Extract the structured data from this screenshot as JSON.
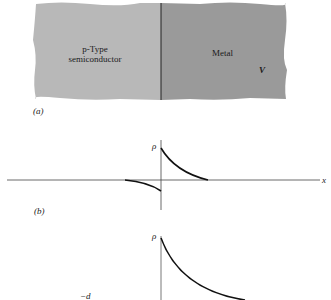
{
  "panel_a": {
    "caption": "(a)",
    "semiconductor_label_line1": "p-Type",
    "semiconductor_label_line2": "semiconductor",
    "metal_label": "Metal",
    "voltage_label": "V",
    "colors": {
      "semiconductor": "#b8b8b8",
      "metal": "#9a9a9a",
      "interface": "#222222"
    }
  },
  "panel_b": {
    "caption": "(b)",
    "y_axis_label": "ρ",
    "x_axis_label": "x"
  },
  "panel_c": {
    "y_axis_label": "ρ",
    "tick_label": "−d"
  }
}
